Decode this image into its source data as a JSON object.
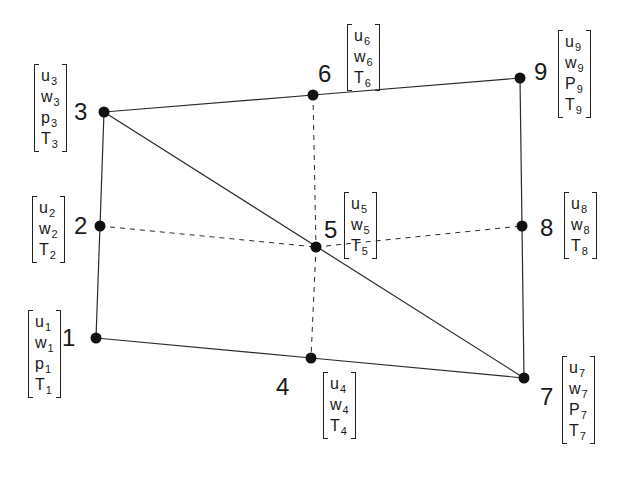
{
  "diagram": {
    "nodes": [
      {
        "id": "1",
        "x": 96,
        "y": 338,
        "dofs": [
          {
            "sym": "u",
            "sub": "1"
          },
          {
            "sym": "w",
            "sub": "1"
          },
          {
            "sym": "p",
            "sub": "1"
          },
          {
            "sym": "T",
            "sub": "1"
          }
        ]
      },
      {
        "id": "2",
        "x": 100,
        "y": 226,
        "dofs": [
          {
            "sym": "u",
            "sub": "2"
          },
          {
            "sym": "w",
            "sub": "2"
          },
          {
            "sym": "T",
            "sub": "2"
          }
        ]
      },
      {
        "id": "3",
        "x": 104,
        "y": 112,
        "dofs": [
          {
            "sym": "u",
            "sub": "3"
          },
          {
            "sym": "w",
            "sub": "3"
          },
          {
            "sym": "p",
            "sub": "3"
          },
          {
            "sym": "T",
            "sub": "3"
          }
        ]
      },
      {
        "id": "4",
        "x": 311,
        "y": 358,
        "dofs": [
          {
            "sym": "u",
            "sub": "4"
          },
          {
            "sym": "w",
            "sub": "4"
          },
          {
            "sym": "T",
            "sub": "4"
          }
        ]
      },
      {
        "id": "5",
        "x": 316,
        "y": 247,
        "dofs": [
          {
            "sym": "u",
            "sub": "5"
          },
          {
            "sym": "w",
            "sub": "5"
          },
          {
            "sym": "T",
            "sub": "5"
          }
        ]
      },
      {
        "id": "6",
        "x": 313,
        "y": 95,
        "dofs": [
          {
            "sym": "u",
            "sub": "6"
          },
          {
            "sym": "w",
            "sub": "6"
          },
          {
            "sym": "T",
            "sub": "6"
          }
        ]
      },
      {
        "id": "7",
        "x": 524,
        "y": 378,
        "dofs": [
          {
            "sym": "u",
            "sub": "7"
          },
          {
            "sym": "w",
            "sub": "7"
          },
          {
            "sym": "P",
            "sub": "7"
          },
          {
            "sym": "T",
            "sub": "7"
          }
        ]
      },
      {
        "id": "8",
        "x": 522,
        "y": 226,
        "dofs": [
          {
            "sym": "u",
            "sub": "8"
          },
          {
            "sym": "w",
            "sub": "8"
          },
          {
            "sym": "T",
            "sub": "8"
          }
        ]
      },
      {
        "id": "9",
        "x": 520,
        "y": 78,
        "dofs": [
          {
            "sym": "u",
            "sub": "9"
          },
          {
            "sym": "w",
            "sub": "9"
          },
          {
            "sym": "P",
            "sub": "9"
          },
          {
            "sym": "T",
            "sub": "9"
          }
        ]
      }
    ],
    "solid_edges": [
      [
        "1",
        "2"
      ],
      [
        "2",
        "3"
      ],
      [
        "3",
        "6"
      ],
      [
        "6",
        "9"
      ],
      [
        "9",
        "8"
      ],
      [
        "8",
        "7"
      ],
      [
        "7",
        "4"
      ],
      [
        "4",
        "1"
      ],
      [
        "3",
        "7"
      ]
    ],
    "dashed_edges": [
      [
        "2",
        "5"
      ],
      [
        "5",
        "8"
      ],
      [
        "6",
        "5"
      ],
      [
        "5",
        "4"
      ]
    ]
  },
  "labels": {
    "n1": {
      "num": "1",
      "vec": [
        "u",
        "1",
        "w",
        "1",
        "p",
        "1",
        "T",
        "1"
      ]
    },
    "n2": {
      "num": "2"
    },
    "n3": {
      "num": "3"
    },
    "n4": {
      "num": "4"
    },
    "n5": {
      "num": "5"
    },
    "n6": {
      "num": "6"
    },
    "n7": {
      "num": "7"
    },
    "n8": {
      "num": "8"
    },
    "n9": {
      "num": "9"
    }
  },
  "vectors": {
    "n1": [
      {
        "s": "u",
        "i": "1"
      },
      {
        "s": "w",
        "i": "1"
      },
      {
        "s": "p",
        "i": "1"
      },
      {
        "s": "T",
        "i": "1"
      }
    ],
    "n2": [
      {
        "s": "u",
        "i": "2"
      },
      {
        "s": "w",
        "i": "2"
      },
      {
        "s": "T",
        "i": "2"
      }
    ],
    "n3": [
      {
        "s": "u",
        "i": "3"
      },
      {
        "s": "w",
        "i": "3"
      },
      {
        "s": "p",
        "i": "3"
      },
      {
        "s": "T",
        "i": "3"
      }
    ],
    "n4": [
      {
        "s": "u",
        "i": "4"
      },
      {
        "s": "w",
        "i": "4"
      },
      {
        "s": "T",
        "i": "4"
      }
    ],
    "n5": [
      {
        "s": "u",
        "i": "5"
      },
      {
        "s": "w",
        "i": "5"
      },
      {
        "s": "T",
        "i": "5"
      }
    ],
    "n6": [
      {
        "s": "u",
        "i": "6"
      },
      {
        "s": "w",
        "i": "6"
      },
      {
        "s": "T",
        "i": "6"
      }
    ],
    "n7": [
      {
        "s": "u",
        "i": "7"
      },
      {
        "s": "w",
        "i": "7"
      },
      {
        "s": "P",
        "i": "7"
      },
      {
        "s": "T",
        "i": "7"
      }
    ],
    "n8": [
      {
        "s": "u",
        "i": "8"
      },
      {
        "s": "w",
        "i": "8"
      },
      {
        "s": "T",
        "i": "8"
      }
    ],
    "n9": [
      {
        "s": "u",
        "i": "9"
      },
      {
        "s": "w",
        "i": "9"
      },
      {
        "s": "P",
        "i": "9"
      },
      {
        "s": "T",
        "i": "9"
      }
    ]
  }
}
